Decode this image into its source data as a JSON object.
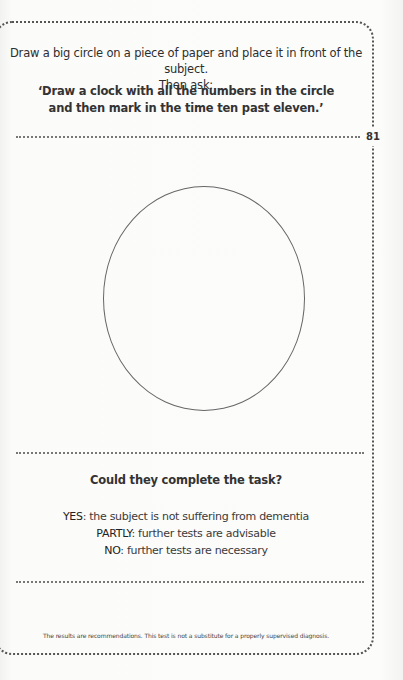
{
  "page": {
    "number": "81"
  },
  "instructions": {
    "intro_line1": "Draw a big circle on a piece of paper and place it in front of the subject.",
    "intro_line2": "Then ask:",
    "quote_line1": "‘Draw a clock with all the numbers in the circle",
    "quote_line2": "and then mark in the time ten past eleven.’"
  },
  "drawing_area": {
    "shape": "circle"
  },
  "assessment": {
    "question": "Could they complete the task?",
    "results": [
      {
        "key": "YES",
        "text": ": the subject is not suffering from dementia"
      },
      {
        "key": "PARTLY",
        "text": ": further tests are advisable"
      },
      {
        "key": "NO",
        "text": ": further tests are necessary"
      }
    ]
  },
  "footer": {
    "disclaimer": "The results are recommendations. This test is not a substitute for a properly supervised diagnosis."
  }
}
